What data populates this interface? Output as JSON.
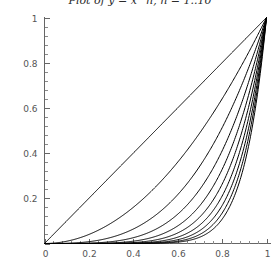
{
  "chart_data": {
    "type": "line",
    "title": "Plot of y = x^n, n = 1..10",
    "xlabel": "",
    "ylabel": "",
    "xlim": [
      0,
      1
    ],
    "ylim": [
      0,
      1
    ],
    "grid": false,
    "legend": "none",
    "x_ticks": [
      "0",
      "0.2",
      "0.4",
      "0.6",
      "0.8",
      "1"
    ],
    "x_tick_values": [
      0,
      0.2,
      0.4,
      0.6,
      0.8,
      1
    ],
    "y_ticks": [
      "0",
      "0.2",
      "0.4",
      "0.6",
      "0.8",
      "1"
    ],
    "y_tick_values": [
      0,
      0.2,
      0.4,
      0.6,
      0.8,
      1
    ],
    "x_minor_count": 4,
    "y_minor_count": 4,
    "x": [
      0,
      0.05,
      0.1,
      0.15,
      0.2,
      0.25,
      0.3,
      0.35,
      0.4,
      0.45,
      0.5,
      0.55,
      0.6,
      0.65,
      0.7,
      0.75,
      0.8,
      0.85,
      0.9,
      0.95,
      1
    ],
    "series": [
      {
        "name": "y = x^1",
        "exponent": 1,
        "color": "#000000",
        "values": [
          0,
          0.05,
          0.1,
          0.15,
          0.2,
          0.25,
          0.3,
          0.35,
          0.4,
          0.45,
          0.5,
          0.55,
          0.6,
          0.65,
          0.7,
          0.75,
          0.8,
          0.85,
          0.9,
          0.95,
          1
        ]
      },
      {
        "name": "y = x^2",
        "exponent": 2,
        "color": "#000000",
        "values": [
          0,
          0.0025,
          0.01,
          0.0225,
          0.04,
          0.0625,
          0.09,
          0.1225,
          0.16,
          0.2025,
          0.25,
          0.3025,
          0.36,
          0.4225,
          0.49,
          0.5625,
          0.64,
          0.7225,
          0.81,
          0.9025,
          1
        ]
      },
      {
        "name": "y = x^3",
        "exponent": 3,
        "color": "#000000",
        "values": [
          0,
          0.000125,
          0.001,
          0.003375,
          0.008,
          0.015625,
          0.027,
          0.042875,
          0.064,
          0.091125,
          0.125,
          0.166375,
          0.216,
          0.274625,
          0.343,
          0.421875,
          0.512,
          0.614125,
          0.729,
          0.857375,
          1
        ]
      },
      {
        "name": "y = x^4",
        "exponent": 4,
        "color": "#000000",
        "values": [
          0,
          6.25e-06,
          0.0001,
          0.00050625,
          0.0016,
          0.00390625,
          0.0081,
          0.01500625,
          0.0256,
          0.04100625,
          0.0625,
          0.09150625,
          0.1296,
          0.17850625,
          0.2401,
          0.31640625,
          0.4096,
          0.52200625,
          0.6561,
          0.81450625,
          1
        ]
      },
      {
        "name": "y = x^5",
        "exponent": 5,
        "color": "#000000",
        "values": [
          0,
          3e-07,
          1e-05,
          7.59e-05,
          0.00032,
          0.00097656,
          0.00243,
          0.00525219,
          0.01024,
          0.01845281,
          0.03125,
          0.05032844,
          0.07776,
          0.11602906,
          0.16807,
          0.23730469,
          0.32768,
          0.44370531,
          0.59049,
          0.77378094,
          1
        ]
      },
      {
        "name": "y = x^6",
        "exponent": 6,
        "color": "#000000",
        "values": [
          0,
          1.56e-08,
          1e-06,
          1.14e-05,
          6.4e-05,
          0.00024414,
          0.000729,
          0.00183827,
          0.004096,
          0.00830377,
          0.015625,
          0.02768064,
          0.046656,
          0.07541889,
          0.117649,
          0.17797852,
          0.262144,
          0.37714951,
          0.531441,
          0.73509189,
          1
        ]
      },
      {
        "name": "y = x^7",
        "exponent": 7,
        "color": "#000000",
        "values": [
          0,
          7.8e-10,
          1e-07,
          1.7e-06,
          1.28e-05,
          6.104e-05,
          0.0002187,
          0.00064339,
          0.0016384,
          0.0037367,
          0.0078125,
          0.01522435,
          0.0279936,
          0.04902228,
          0.0823543,
          0.13348389,
          0.2097152,
          0.32057708,
          0.4782969,
          0.6983373,
          1
        ]
      },
      {
        "name": "y = x^8",
        "exponent": 8,
        "color": "#000000",
        "values": [
          0,
          3.9e-11,
          1e-08,
          2.6e-07,
          2.56e-06,
          1.526e-05,
          6.561e-05,
          0.00022519,
          0.00065536,
          0.00168151,
          0.00390625,
          0.00837339,
          0.01679616,
          0.03186448,
          0.05764801,
          0.10011292,
          0.16777216,
          0.27249052,
          0.43046721,
          0.66342043,
          1
        ]
      },
      {
        "name": "y = x^9",
        "exponent": 9,
        "color": "#000000",
        "values": [
          0,
          1.9e-12,
          1e-09,
          3.8e-08,
          5.12e-07,
          3.8147e-06,
          1.9683e-05,
          7.88155e-05,
          0.000262144,
          0.00075668,
          0.001953125,
          0.004605366,
          0.010077696,
          0.02071191,
          0.040353607,
          0.075084686,
          0.134217728,
          0.23161694,
          0.387420489,
          0.630249409,
          1
        ]
      },
      {
        "name": "y = x^10",
        "exponent": 10,
        "color": "#000000",
        "values": [
          0,
          1e-13,
          1e-10,
          5.8e-09,
          1.024e-07,
          9.5367e-07,
          5.9049e-06,
          2.75854e-05,
          0.0001048576,
          0.000340506,
          0.0009765625,
          0.0025329511,
          0.0060466176,
          0.0134627415,
          0.0282475249,
          0.0563135147,
          0.1073741824,
          0.1968744043,
          0.3486784401,
          0.5987369392,
          1
        ]
      }
    ],
    "annotations": [],
    "note": "All curves pass through the origin (0,0) and converge at the point (1,1)."
  }
}
